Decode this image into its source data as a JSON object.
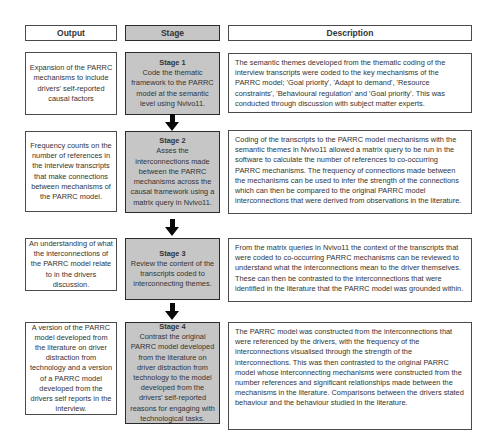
{
  "headers": {
    "output": "Output",
    "stage": "Stage",
    "description": "Description"
  },
  "rows": [
    {
      "output": "Expansion of the PARRC mechanisms to include drivers' self-reported causal factors",
      "stage_title": "Stage 1",
      "stage_body": "Code the thematic framework to the PARRC model at the semantic level using Nvivo11.",
      "description": "The semantic themes developed from the thematic coding of the interview transcripts were coded to the key mechanisms of the PARRC model; 'Goal priority', 'Adapt to demand', 'Resource constraints', 'Behavioural regulation' and 'Goal priority'. This was conducted through discussion with subject matter experts."
    },
    {
      "output": "Frequency counts on the number of references in the interview transcripts that make connections between mechanisms of the PARRC model.",
      "stage_title": "Stage 2",
      "stage_body": "Asses the interconnections made between the PARRC mechanisms across the causal framework using a matrix query in Nvivo11.",
      "description": "Coding of the transcripts to the PARRC model mechanisms with the semantic themes in Nvivo11 allowed a matrix query to be run in the software to calculate the number of references to co-occurring PARRC mechanisms. The frequency of connections made between the mechanisms can be used to infer the strength of the connections which can then be compared to the original PARRC model interconnections that were derived from observations in the literature."
    },
    {
      "output": "An understanding of what the interconnections of the PARRC model relate to in the drivers discussion.",
      "stage_title": "Stage 3",
      "stage_body": "Review the content of the transcripts coded to interconnecting themes.",
      "description": "From the matrix queries in Nvivo11 the context of the transcripts that were coded to co-occurring PARRC mechanisms can be reviewed to understand what the interconnections mean to the driver themselves. These can then be contrasted to the interconnections that were identified in the literature that the PARRC model was grounded within."
    },
    {
      "output": "A version of the PARRC model developed from the literature on driver distraction from technology and a version of a PARRC model developed from the drivers self reports in the interview.",
      "stage_title": "Stage 4",
      "stage_body": "Contrast the original PARRC model developed from the literature on driver distraction from technology to the model developed from the drivers' self-reported reasons for engaging with technological tasks.",
      "description": "The PARRC model was constructed from the interconnections that were referenced by the drivers, with the frequency of the interconnections visualised through the strength of the interconnections. This was then contrasted to the original PARRC model whose interconnecting mechanisms were constructed from the number references and significant relationships made between the mechanisms in the literature. Comparisons between the drivers stated behaviour and the behaviour studied in the literature."
    }
  ],
  "arrows": {
    "direction": "down",
    "count": 3
  },
  "colors": {
    "bg": "#ffffff",
    "stage_fill": "#c6c6c6",
    "box_border": "#4a4a4a",
    "stage_border": "#2b2b2b",
    "arrow": "#0a0a0a",
    "text": "#333333"
  }
}
